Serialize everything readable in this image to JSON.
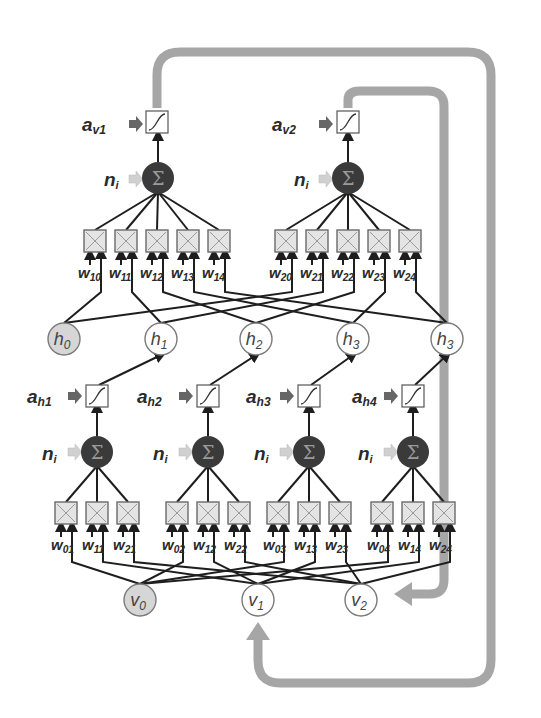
{
  "diagram": {
    "title": "",
    "colors": {
      "line": "#1e1e1e",
      "feedback_arrow": "#a6a6a6",
      "sum_node_fill": "#3a3a3a",
      "sum_symbol": "#9a9a9a",
      "product_box_fill": "#e4e4e4",
      "product_box_stroke": "#6a6a6a",
      "bias_node_fill": "#d6d6d6",
      "node_stroke": "#7a7a7a",
      "ni_arrow": "#cfcfcf",
      "a_arrow": "#666666"
    },
    "output_layer": {
      "units": [
        {
          "activation_label": "a",
          "activation_sub": "v1",
          "input_label": "n",
          "input_sub": "i",
          "sum_symbol": "Σ",
          "weights": [
            {
              "w": "w",
              "sub": "10"
            },
            {
              "w": "w",
              "sub": "11"
            },
            {
              "w": "w",
              "sub": "12"
            },
            {
              "w": "w",
              "sub": "13"
            },
            {
              "w": "w",
              "sub": "14"
            }
          ]
        },
        {
          "activation_label": "a",
          "activation_sub": "v2",
          "input_label": "n",
          "input_sub": "i",
          "sum_symbol": "Σ",
          "weights": [
            {
              "w": "w",
              "sub": "20"
            },
            {
              "w": "w",
              "sub": "21"
            },
            {
              "w": "w",
              "sub": "22"
            },
            {
              "w": "w",
              "sub": "23"
            },
            {
              "w": "w",
              "sub": "24"
            }
          ]
        }
      ]
    },
    "hidden_nodes": [
      {
        "label": "h",
        "sub": "0",
        "bias": true
      },
      {
        "label": "h",
        "sub": "1",
        "bias": false
      },
      {
        "label": "h",
        "sub": "2",
        "bias": false
      },
      {
        "label": "h",
        "sub": "3",
        "bias": false
      },
      {
        "label": "h",
        "sub": "3",
        "bias": false
      }
    ],
    "hidden_layer": {
      "units": [
        {
          "activation_label": "a",
          "activation_sub": "h1",
          "input_label": "n",
          "input_sub": "i",
          "sum_symbol": "Σ",
          "weights": [
            {
              "w": "w",
              "sub": "01"
            },
            {
              "w": "w",
              "sub": "11"
            },
            {
              "w": "w",
              "sub": "21"
            }
          ]
        },
        {
          "activation_label": "a",
          "activation_sub": "h2",
          "input_label": "n",
          "input_sub": "i",
          "sum_symbol": "Σ",
          "weights": [
            {
              "w": "w",
              "sub": "02"
            },
            {
              "w": "w",
              "sub": "12"
            },
            {
              "w": "w",
              "sub": "22"
            }
          ]
        },
        {
          "activation_label": "a",
          "activation_sub": "h3",
          "input_label": "n",
          "input_sub": "i",
          "sum_symbol": "Σ",
          "weights": [
            {
              "w": "w",
              "sub": "03"
            },
            {
              "w": "w",
              "sub": "13"
            },
            {
              "w": "w",
              "sub": "23"
            }
          ]
        },
        {
          "activation_label": "a",
          "activation_sub": "h4",
          "input_label": "n",
          "input_sub": "i",
          "sum_symbol": "Σ",
          "weights": [
            {
              "w": "w",
              "sub": "04"
            },
            {
              "w": "w",
              "sub": "14"
            },
            {
              "w": "w",
              "sub": "24"
            }
          ]
        }
      ]
    },
    "visible_nodes": [
      {
        "label": "v",
        "sub": "0",
        "bias": true
      },
      {
        "label": "v",
        "sub": "1",
        "bias": false
      },
      {
        "label": "v",
        "sub": "2",
        "bias": false
      }
    ]
  }
}
